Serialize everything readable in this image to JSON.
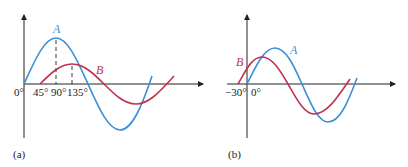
{
  "panels": [
    {
      "id": "a",
      "caption": "(a)",
      "curve_a_label": "A",
      "curve_b_label": "B",
      "ticks": [
        "0°",
        "45°",
        "90°",
        "135°"
      ],
      "colors": {
        "A": "#3a8fd6",
        "B": "#c0334f"
      }
    },
    {
      "id": "b",
      "caption": "(b)",
      "curve_a_label": "A",
      "curve_b_label": "B",
      "ticks": [
        "−30°",
        "0°"
      ],
      "colors": {
        "A": "#3a8fd6",
        "B": "#c0334f"
      }
    }
  ]
}
